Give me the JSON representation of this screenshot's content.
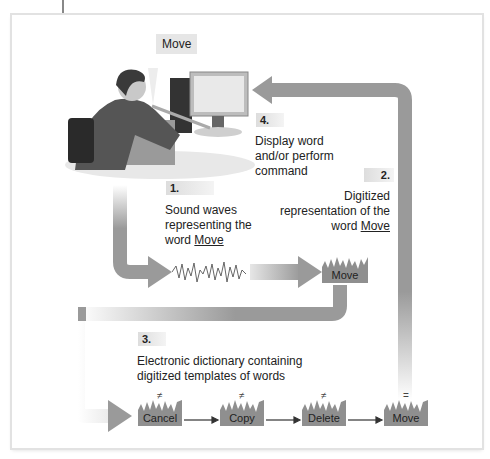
{
  "speech_bubble": "Move",
  "steps": [
    {
      "num": "1.",
      "lines": [
        "Sound waves",
        "representing the"
      ],
      "last_prefix": "word ",
      "last_word": "Move"
    },
    {
      "num": "2.",
      "lines": [
        "Digitized",
        "representation of the"
      ],
      "last_prefix": "word ",
      "last_word": "Move"
    },
    {
      "num": "3.",
      "lines": [
        "Electronic dictionary containing",
        "digitized templates of words"
      ]
    },
    {
      "num": "4.",
      "lines": [
        "Display word",
        "and/or perform",
        "command"
      ]
    }
  ],
  "digitized_word": "Move",
  "templates": [
    {
      "word": "Cancel",
      "match": "≠"
    },
    {
      "word": "Copy",
      "match": "≠"
    },
    {
      "word": "Delete",
      "match": "≠"
    },
    {
      "word": "Move",
      "match": "="
    }
  ],
  "colors": {
    "arrow": "#9a9a9a",
    "block": "#8f8f8f"
  }
}
